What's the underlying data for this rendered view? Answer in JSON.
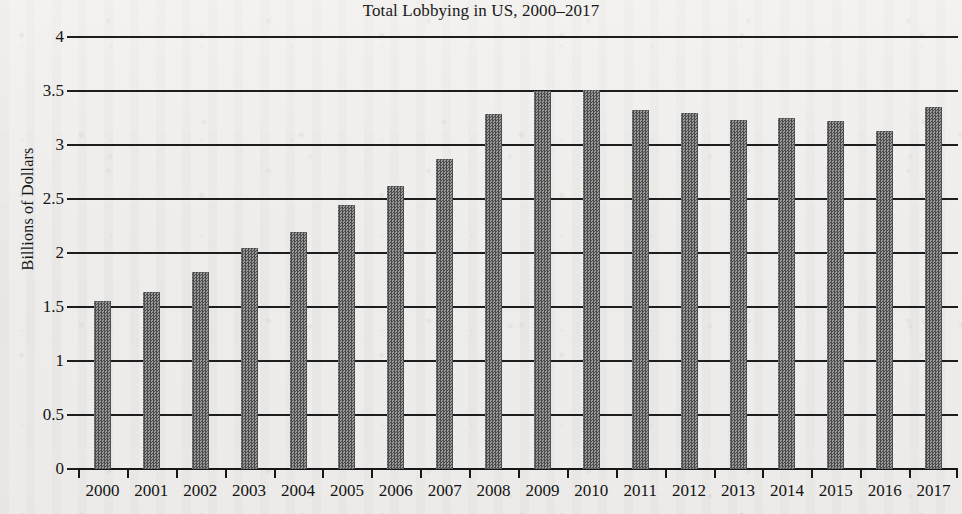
{
  "chart_data": {
    "type": "bar",
    "title": "Total Lobbying in US, 2000–2017",
    "xlabel": "",
    "ylabel": "Billions of Dollars",
    "ylim": [
      0,
      4
    ],
    "ytick_labels": [
      "4",
      "3.5",
      "3",
      "2.5",
      "2",
      "1.5",
      "1",
      "0.5",
      "0"
    ],
    "ytick_values": [
      4,
      3.5,
      3,
      2.5,
      2,
      1.5,
      1,
      0.5,
      0
    ],
    "grid": true,
    "legend": "none",
    "bar_color": "#6e6e6e",
    "categories": [
      "2000",
      "2001",
      "2002",
      "2003",
      "2004",
      "2005",
      "2006",
      "2007",
      "2008",
      "2009",
      "2010",
      "2011",
      "2012",
      "2013",
      "2014",
      "2015",
      "2016",
      "2017"
    ],
    "values": [
      1.56,
      1.64,
      1.82,
      2.05,
      2.19,
      2.44,
      2.62,
      2.87,
      3.29,
      3.5,
      3.51,
      3.32,
      3.3,
      3.23,
      3.25,
      3.22,
      3.13,
      3.35
    ]
  }
}
